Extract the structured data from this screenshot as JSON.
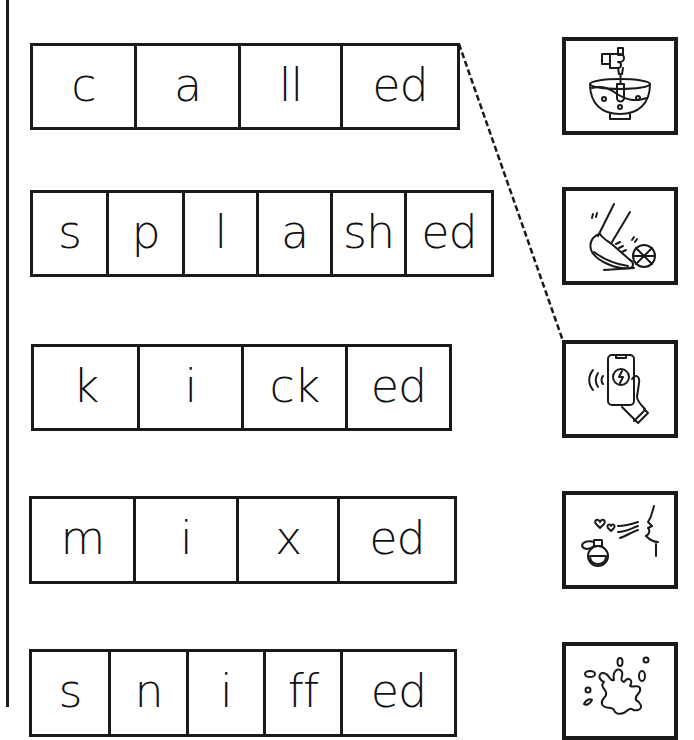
{
  "worksheet": {
    "rows": [
      {
        "word": "called",
        "segments": [
          "c",
          "a",
          "ll",
          "ed"
        ]
      },
      {
        "word": "splashed",
        "segments": [
          "s",
          "p",
          "l",
          "a",
          "sh",
          "ed"
        ]
      },
      {
        "word": "kicked",
        "segments": [
          "k",
          "i",
          "ck",
          "ed"
        ]
      },
      {
        "word": "mixed",
        "segments": [
          "m",
          "i",
          "x",
          "ed"
        ]
      },
      {
        "word": "sniffed",
        "segments": [
          "s",
          "n",
          "i",
          "ff",
          "ed"
        ]
      }
    ],
    "pictures": [
      {
        "icon": "mixing-bowl-icon",
        "meaning": "mixing"
      },
      {
        "icon": "kicking-ball-icon",
        "meaning": "kicking"
      },
      {
        "icon": "phone-call-icon",
        "meaning": "calling"
      },
      {
        "icon": "sniffing-perfume-icon",
        "meaning": "sniffing"
      },
      {
        "icon": "splash-icon",
        "meaning": "splashing"
      }
    ],
    "connections": [
      {
        "from_row": 0,
        "to_picture": 2,
        "style": "dashed"
      }
    ],
    "colors": {
      "ink": "#1a1a1a",
      "paper": "#ffffff"
    }
  }
}
